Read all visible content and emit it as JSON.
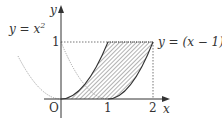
{
  "diagram": {
    "axes": {
      "x_label": "x",
      "y_label": "y",
      "origin_label": "O"
    },
    "ticks": {
      "x": [
        "1",
        "2"
      ],
      "y": [
        "1"
      ]
    },
    "curves": [
      {
        "name": "parabola-1",
        "label_lhs": "y = x",
        "label_sup": "2",
        "equation": "y = x^2"
      },
      {
        "name": "parabola-2",
        "label_lhs": "y = (x − 1)",
        "label_sup": "2",
        "equation": "y = (x - 1)^2"
      }
    ],
    "shaded_region": "Region bounded by y = x^2, y = (x-1)^2, y = 1, between x = 0 and x = 2",
    "colors": {
      "curve": "#333333",
      "dotted": "#888888",
      "hatch": "#555555",
      "axis": "#333333"
    }
  }
}
